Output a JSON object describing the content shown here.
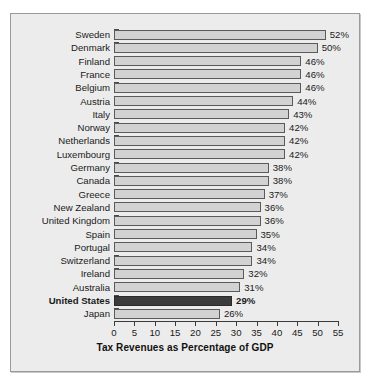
{
  "chart_data": {
    "type": "bar",
    "orientation": "horizontal",
    "title": "",
    "subtitle": "",
    "xlabel": "Tax Revenues as Percentage of GDP",
    "ylabel": "",
    "xlim": [
      0,
      55
    ],
    "xticks": [
      0,
      5,
      10,
      15,
      20,
      25,
      30,
      35,
      40,
      45,
      50,
      55
    ],
    "xtick_labels": [
      "0",
      "5",
      "10",
      "15",
      "20",
      "25",
      "30",
      "35",
      "40",
      "45",
      "50",
      "55"
    ],
    "grid": false,
    "legend": false,
    "value_label_suffix": "%",
    "categories": [
      "Sweden",
      "Denmark",
      "Finland",
      "France",
      "Belgium",
      "Austria",
      "Italy",
      "Norway",
      "Netherlands",
      "Luxembourg",
      "Germany",
      "Canada",
      "Greece",
      "New Zealand",
      "United Kingdom",
      "Spain",
      "Portugal",
      "Switzerland",
      "Ireland",
      "Australia",
      "United States",
      "Japan"
    ],
    "values": [
      52,
      50,
      46,
      46,
      46,
      44,
      43,
      42,
      42,
      42,
      38,
      38,
      37,
      36,
      36,
      35,
      34,
      34,
      32,
      31,
      29,
      26
    ],
    "value_labels": [
      "52%",
      "50%",
      "46%",
      "46%",
      "46%",
      "44%",
      "43%",
      "42%",
      "42%",
      "42%",
      "38%",
      "38%",
      "37%",
      "36%",
      "36%",
      "35%",
      "34%",
      "34%",
      "32%",
      "31%",
      "29%",
      "26%"
    ],
    "highlight_category": "United States",
    "colors": {
      "bar_fill": "#d2d2d2",
      "bar_edge": "#5a5a5a",
      "highlight_fill": "#3c3c3c",
      "highlight_edge": "#2a2a2a",
      "figure_background": "#ececec",
      "figure_border": "#9a9a9a",
      "text": "#1a1a1a",
      "axis": "#3a3a3a"
    }
  }
}
